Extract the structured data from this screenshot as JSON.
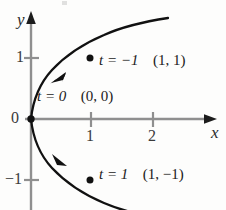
{
  "figure": {
    "title": "",
    "axes": {
      "x_axis_label": "x",
      "y_axis_label": "y",
      "origin_label": "0",
      "x_ticks": [
        {
          "value": 1,
          "label": "1",
          "px": 91
        },
        {
          "value": 2,
          "label": "2",
          "px": 153
        }
      ],
      "y_ticks": [
        {
          "value": 1,
          "label": "1",
          "px": 58
        },
        {
          "value": -1,
          "label": "−1",
          "px": 180
        }
      ],
      "x_range": [
        -0.5,
        2.95
      ],
      "y_range": [
        -1.55,
        1.6
      ],
      "axis_color": "#8a8a8a",
      "arrow_color": "#1a1a1a"
    },
    "curve": {
      "color": "#111111",
      "equations": {
        "x": "t^2",
        "y": "-t"
      },
      "t_range": [
        -1.55,
        1.55
      ],
      "direction_arrows": 2
    },
    "annotations": [
      {
        "name": "point-t-minus-1",
        "t_text": "t = −1",
        "coord_text": "(1, 1)",
        "point": {
          "x": 1,
          "y": 1
        },
        "point_px": {
          "x": 90,
          "y": 58
        },
        "label_px": {
          "x": 99,
          "y": 60
        }
      },
      {
        "name": "point-t-zero",
        "t_text": "t = 0",
        "coord_text": "(0, 0)",
        "point": {
          "x": 0,
          "y": 0
        },
        "point_px": {
          "x": 31,
          "y": 119
        },
        "label_px": {
          "x": 37,
          "y": 96
        }
      },
      {
        "name": "point-t-one",
        "t_text": "t = 1",
        "coord_text": "(1, −1)",
        "point": {
          "x": 1,
          "y": -1
        },
        "point_px": {
          "x": 90,
          "y": 180
        },
        "label_px": {
          "x": 99,
          "y": 173
        }
      }
    ]
  }
}
